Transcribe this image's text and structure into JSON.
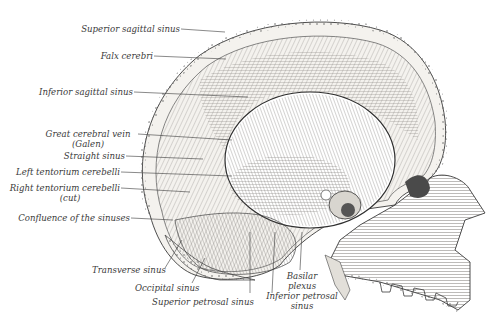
{
  "figure": {
    "colors": {
      "ink": "#3a3a3a",
      "background": "#ffffff",
      "bone": "#f4f2ee",
      "shade": "#c9c6c0"
    }
  },
  "labels": {
    "superior_sagittal_sinus": "Superior sagittal sinus",
    "falx_cerebri": "Falx cerebri",
    "inferior_sagittal_sinus": "Inferior sagittal sinus",
    "great_cerebral_vein_1": "Great cerebral vein",
    "great_cerebral_vein_2": "(Galen)",
    "straight_sinus": "Straight sinus",
    "left_tentorium": "Left tentorium cerebelli",
    "right_tentorium_1": "Right tentorium cerebelli",
    "right_tentorium_2": "(cut)",
    "confluence": "Confluence of the sinuses",
    "transverse_sinus": "Transverse sinus",
    "occipital_sinus": "Occipital sinus",
    "superior_petrosal_sinus": "Superior petrosal sinus",
    "basilar_plexus_1": "Basilar",
    "basilar_plexus_2": "plexus",
    "inferior_petrosal_1": "Inferior petrosal",
    "inferior_petrosal_2": "sinus"
  }
}
